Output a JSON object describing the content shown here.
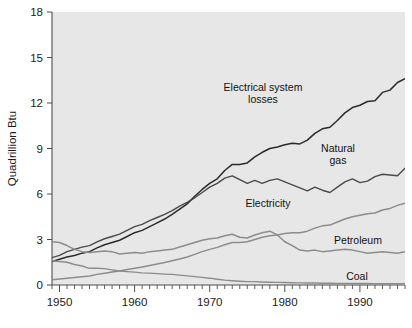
{
  "chart_data": {
    "type": "line",
    "title": "",
    "xlabel": "",
    "ylabel": "Quadrillion Btu",
    "xlim": [
      1949,
      1996
    ],
    "ylim": [
      0,
      18
    ],
    "yticks": [
      0,
      3,
      6,
      9,
      12,
      15,
      18
    ],
    "xticks": [
      1950,
      1960,
      1970,
      1980,
      1990
    ],
    "xtick_labels": [
      "1950",
      "1960",
      "1970",
      "1980",
      "1990"
    ],
    "ytick_labels": [
      "0",
      "3",
      "6",
      "9",
      "12",
      "15",
      "18"
    ],
    "grid": false,
    "legend": "inline-annotations",
    "plot_background": "#e7e7e7",
    "line_color": "#4a4a4a",
    "line_color_dark": "#2b2b2b",
    "x": [
      1949,
      1950,
      1951,
      1952,
      1953,
      1954,
      1955,
      1956,
      1957,
      1958,
      1959,
      1960,
      1961,
      1962,
      1963,
      1964,
      1965,
      1966,
      1967,
      1968,
      1969,
      1970,
      1971,
      1972,
      1973,
      1974,
      1975,
      1976,
      1977,
      1978,
      1979,
      1980,
      1981,
      1982,
      1983,
      1984,
      1985,
      1986,
      1987,
      1988,
      1989,
      1990,
      1991,
      1992,
      1993,
      1994,
      1995,
      1996
    ],
    "series": [
      {
        "name": "Electrical system losses",
        "label": "Electrical system losses",
        "label_lines": [
          "Electrical system",
          "losses"
        ],
        "color": "#2b2b2b",
        "width": 1.5,
        "values": [
          1.55,
          1.7,
          1.85,
          1.95,
          2.1,
          2.2,
          2.45,
          2.65,
          2.8,
          2.95,
          3.2,
          3.45,
          3.6,
          3.85,
          4.1,
          4.35,
          4.65,
          5.0,
          5.35,
          5.85,
          6.3,
          6.7,
          7.0,
          7.55,
          7.95,
          7.95,
          8.05,
          8.45,
          8.75,
          9.0,
          9.1,
          9.25,
          9.35,
          9.3,
          9.55,
          10.0,
          10.3,
          10.4,
          10.85,
          11.35,
          11.7,
          11.85,
          12.1,
          12.15,
          12.7,
          12.85,
          13.35,
          13.6
        ]
      },
      {
        "name": "Natural gas",
        "label": "Natural gas",
        "label_lines": [
          "Natural",
          "gas"
        ],
        "color": "#4a4a4a",
        "width": 1.4,
        "values": [
          1.8,
          1.95,
          2.2,
          2.35,
          2.5,
          2.6,
          2.85,
          3.05,
          3.2,
          3.35,
          3.6,
          3.85,
          4.0,
          4.25,
          4.45,
          4.65,
          4.9,
          5.2,
          5.45,
          5.75,
          6.1,
          6.45,
          6.7,
          7.05,
          7.2,
          6.95,
          6.7,
          6.9,
          6.7,
          6.9,
          7.0,
          6.8,
          6.6,
          6.4,
          6.2,
          6.45,
          6.25,
          6.1,
          6.45,
          6.8,
          7.0,
          6.75,
          6.85,
          7.15,
          7.3,
          7.25,
          7.2,
          7.7
        ]
      },
      {
        "name": "Electricity",
        "label": "Electricity",
        "label_lines": [
          "Electricity"
        ],
        "color": "#8c8c8c",
        "width": 1.5,
        "values": [
          0.35,
          0.4,
          0.45,
          0.5,
          0.55,
          0.6,
          0.7,
          0.78,
          0.85,
          0.92,
          1.02,
          1.1,
          1.18,
          1.28,
          1.38,
          1.48,
          1.6,
          1.72,
          1.85,
          2.02,
          2.2,
          2.35,
          2.48,
          2.65,
          2.8,
          2.8,
          2.85,
          3.0,
          3.15,
          3.25,
          3.3,
          3.4,
          3.45,
          3.45,
          3.55,
          3.75,
          3.9,
          3.95,
          4.15,
          4.35,
          4.5,
          4.6,
          4.7,
          4.75,
          4.95,
          5.05,
          5.25,
          5.4
        ]
      },
      {
        "name": "Petroleum",
        "label": "Petroleum",
        "label_lines": [
          "Petroleum"
        ],
        "color": "#8c8c8c",
        "width": 1.5,
        "values": [
          2.85,
          2.8,
          2.6,
          2.35,
          2.2,
          2.15,
          2.2,
          2.25,
          2.2,
          2.05,
          2.1,
          2.15,
          2.1,
          2.2,
          2.25,
          2.3,
          2.35,
          2.5,
          2.65,
          2.8,
          2.95,
          3.05,
          3.1,
          3.25,
          3.35,
          3.15,
          3.1,
          3.3,
          3.45,
          3.55,
          3.3,
          2.85,
          2.6,
          2.3,
          2.25,
          2.3,
          2.2,
          2.25,
          2.3,
          2.35,
          2.3,
          2.2,
          2.1,
          2.15,
          2.2,
          2.15,
          2.1,
          2.2
        ]
      },
      {
        "name": "Coal",
        "label": "Coal",
        "label_lines": [
          "Coal"
        ],
        "color": "#8c8c8c",
        "width": 1.4,
        "values": [
          1.6,
          1.55,
          1.5,
          1.35,
          1.25,
          1.1,
          1.1,
          1.08,
          1.0,
          0.92,
          0.88,
          0.85,
          0.8,
          0.78,
          0.75,
          0.72,
          0.7,
          0.65,
          0.6,
          0.55,
          0.5,
          0.45,
          0.38,
          0.32,
          0.28,
          0.25,
          0.22,
          0.22,
          0.2,
          0.18,
          0.17,
          0.16,
          0.15,
          0.14,
          0.13,
          0.13,
          0.12,
          0.12,
          0.11,
          0.11,
          0.1,
          0.1,
          0.1,
          0.09,
          0.09,
          0.09,
          0.09,
          0.09
        ]
      }
    ],
    "annotations": [
      {
        "name": "electrical-system-losses",
        "text": "Electrical system losses",
        "lines": [
          "Electrical system",
          "losses"
        ],
        "x": 263,
        "y": 91,
        "anchor": "center"
      },
      {
        "name": "natural-gas",
        "text": "Natural gas",
        "lines": [
          "Natural",
          "gas"
        ],
        "x": 338,
        "y": 152,
        "anchor": "center"
      },
      {
        "name": "electricity",
        "text": "Electricity",
        "lines": [
          "Electricity"
        ],
        "x": 268,
        "y": 207,
        "anchor": "center"
      },
      {
        "name": "petroleum",
        "text": "Petroleum",
        "lines": [
          "Petroleum"
        ],
        "x": 358,
        "y": 244,
        "anchor": "center"
      },
      {
        "name": "coal",
        "text": "Coal",
        "lines": [
          "Coal"
        ],
        "x": 357,
        "y": 280,
        "anchor": "center"
      }
    ]
  }
}
